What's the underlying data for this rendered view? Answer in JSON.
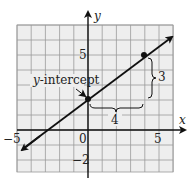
{
  "chart_data": {
    "type": "line",
    "title": "",
    "xlabel": "x",
    "ylabel": "y",
    "xlim": [
      -5,
      6
    ],
    "ylim": [
      -3,
      7.5
    ],
    "grid": true,
    "x_ticks_labeled": [
      "-5",
      "0",
      "5"
    ],
    "y_ticks_labeled": [
      "5",
      "-2"
    ],
    "series": [
      {
        "name": "line",
        "slope": 0.75,
        "intercept": 2,
        "points": [
          {
            "x": 0,
            "y": 2
          },
          {
            "x": 4,
            "y": 5
          }
        ]
      }
    ],
    "annotations": [
      {
        "text": "y-intercept",
        "points_to": {
          "x": 0,
          "y": 2
        }
      },
      {
        "text": "4",
        "type": "horizontal-run-brace",
        "from_x": 0,
        "to_x": 4,
        "at_y": 1.5
      },
      {
        "text": "3",
        "type": "vertical-rise-brace",
        "from_y": 2,
        "to_y": 5,
        "at_x": 4.5
      }
    ]
  },
  "labels": {
    "x_axis": "x",
    "y_axis": "y",
    "tick_neg5": "−5",
    "tick_zero": "0",
    "tick_x5": "5",
    "tick_y5": "5",
    "tick_neg2": "−2",
    "intercept_prefix": "y",
    "intercept_suffix": "-intercept",
    "run": "4",
    "rise": "3"
  },
  "colors": {
    "grid": "#9a9a9a",
    "grid_bg": "#eeeeee",
    "axis": "#111111",
    "line": "#111111"
  }
}
